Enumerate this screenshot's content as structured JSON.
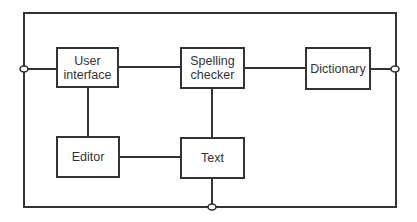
{
  "diagram": {
    "type": "block-diagram",
    "nodes": [
      {
        "id": "user_interface",
        "label": "User\ninterface",
        "line1": "User",
        "line2": "interface"
      },
      {
        "id": "spelling_checker",
        "label": "Spelling\nchecker",
        "line1": "Spelling",
        "line2": "checker"
      },
      {
        "id": "dictionary",
        "label": "Dictionary"
      },
      {
        "id": "editor",
        "label": "Editor"
      },
      {
        "id": "text",
        "label": "Text"
      }
    ],
    "edges": [
      {
        "from": "user_interface",
        "to": "spelling_checker"
      },
      {
        "from": "spelling_checker",
        "to": "dictionary"
      },
      {
        "from": "user_interface",
        "to": "editor"
      },
      {
        "from": "spelling_checker",
        "to": "text"
      },
      {
        "from": "editor",
        "to": "text"
      },
      {
        "from": "user_interface",
        "to": "left_port"
      },
      {
        "from": "dictionary",
        "to": "right_port"
      },
      {
        "from": "text",
        "to": "bottom_port"
      }
    ],
    "ports": [
      "left_port",
      "right_port",
      "bottom_port"
    ],
    "colors": {
      "stroke": "#333333",
      "background": "#ffffff"
    }
  }
}
